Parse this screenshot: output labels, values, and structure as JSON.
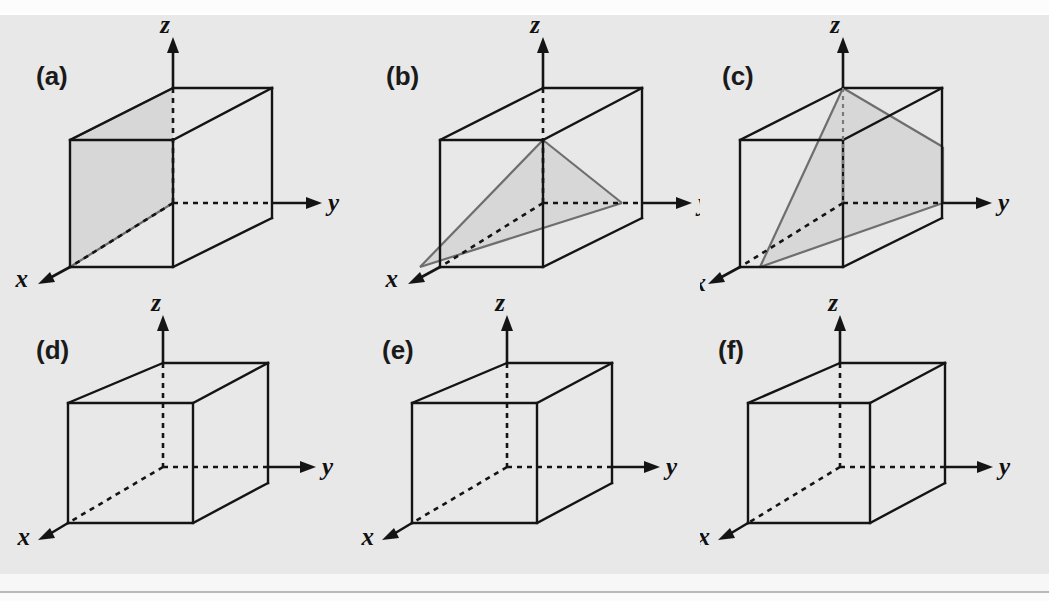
{
  "figure": {
    "type": "diagram",
    "background_color": "#e8e8e8",
    "line_color": "#141414",
    "plane_fill_color": "#d2d2d2",
    "plane_edge_color": "#6e6e6e",
    "rows": 2,
    "columns": 3,
    "axis_labels": {
      "x": "x",
      "y": "y",
      "z": "z"
    },
    "panels": [
      {
        "id": "a",
        "label": "(a)",
        "row": 0,
        "column": 0,
        "has_plane": true,
        "plane_shape": "rectangle",
        "plane_description": "vertical plane containing the z axis cutting the cube front-to-back on the left face",
        "axes": [
          "x",
          "y",
          "z"
        ]
      },
      {
        "id": "b",
        "label": "(b)",
        "row": 0,
        "column": 1,
        "has_plane": true,
        "plane_shape": "triangle",
        "plane_description": "triangular plane joining the x intercept, the y intercept and the top front-right corner",
        "axes": [
          "x",
          "y",
          "z"
        ]
      },
      {
        "id": "c",
        "label": "(c)",
        "row": 0,
        "column": 2,
        "has_plane": true,
        "plane_shape": "parallelogram",
        "plane_description": "inclined parallelogram plane from the top of the z axis down to the x intercept and across the right face",
        "axes": [
          "x",
          "y",
          "z"
        ]
      },
      {
        "id": "d",
        "label": "(d)",
        "row": 1,
        "column": 0,
        "has_plane": false,
        "plane_shape": "none",
        "plane_description": "empty unit cell for the reader to draw a plane",
        "axes": [
          "x",
          "y",
          "z"
        ]
      },
      {
        "id": "e",
        "label": "(e)",
        "row": 1,
        "column": 1,
        "has_plane": false,
        "plane_shape": "none",
        "plane_description": "empty unit cell for the reader to draw a plane",
        "axes": [
          "x",
          "y",
          "z"
        ]
      },
      {
        "id": "f",
        "label": "(f)",
        "row": 1,
        "column": 2,
        "has_plane": false,
        "plane_shape": "none",
        "plane_description": "empty unit cell for the reader to draw a plane",
        "axes": [
          "x",
          "y",
          "z"
        ]
      }
    ]
  }
}
